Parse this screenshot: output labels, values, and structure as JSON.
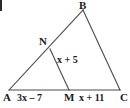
{
  "figure": {
    "kind": "geometry-triangle-diagram",
    "background_color": "#ffffff",
    "line_color": "#4a4a4a",
    "text_color": "#1a1a1a",
    "vertices": {
      "A": {
        "label": "A",
        "x": 9,
        "y": 90
      },
      "B": {
        "label": "B",
        "x": 83,
        "y": 10
      },
      "C": {
        "label": "C",
        "x": 120,
        "y": 90
      },
      "N": {
        "label": "N",
        "x": 50,
        "y": 49
      },
      "M": {
        "label": "M",
        "x": 69,
        "y": 90
      }
    },
    "segment_labels": {
      "AM": "3x – 7",
      "MC": "x + 11",
      "NM": "x + 5"
    }
  }
}
